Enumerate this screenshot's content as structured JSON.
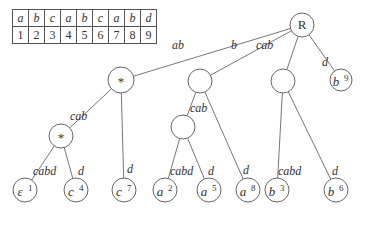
{
  "table": {
    "letters": [
      "a",
      "b",
      "c",
      "a",
      "b",
      "c",
      "a",
      "b",
      "d"
    ],
    "positions": [
      "1",
      "2",
      "3",
      "4",
      "5",
      "6",
      "7",
      "8",
      "9"
    ]
  },
  "tree": {
    "nodes": [
      {
        "id": "root",
        "label": "R",
        "sup": ""
      },
      {
        "id": "n_ab",
        "label": "*",
        "sup": ""
      },
      {
        "id": "n_b",
        "label": "",
        "sup": ""
      },
      {
        "id": "n_cab",
        "label": "",
        "sup": ""
      },
      {
        "id": "leaf_b9",
        "label": "b",
        "sup": "9"
      },
      {
        "id": "n_ab_cab",
        "label": "*",
        "sup": ""
      },
      {
        "id": "n_b_cab",
        "label": "",
        "sup": ""
      },
      {
        "id": "leaf_e1",
        "label": "ε",
        "sup": "1"
      },
      {
        "id": "leaf_c4",
        "label": "c",
        "sup": "4"
      },
      {
        "id": "leaf_c7",
        "label": "c",
        "sup": "7"
      },
      {
        "id": "leaf_a2",
        "label": "a",
        "sup": "2"
      },
      {
        "id": "leaf_a5",
        "label": "a",
        "sup": "5"
      },
      {
        "id": "leaf_a8",
        "label": "a",
        "sup": "8"
      },
      {
        "id": "leaf_b3",
        "label": "b",
        "sup": "3"
      },
      {
        "id": "leaf_b6",
        "label": "b",
        "sup": "6"
      }
    ],
    "edges": [
      {
        "from": "root",
        "to": "n_ab",
        "label": "ab"
      },
      {
        "from": "root",
        "to": "n_b",
        "label": "b"
      },
      {
        "from": "root",
        "to": "n_cab",
        "label": "cab"
      },
      {
        "from": "root",
        "to": "leaf_b9",
        "label": "d"
      },
      {
        "from": "n_ab",
        "to": "n_ab_cab",
        "label": "cab"
      },
      {
        "from": "n_ab",
        "to": "leaf_c7",
        "label": "d"
      },
      {
        "from": "n_ab_cab",
        "to": "leaf_e1",
        "label": "cabd"
      },
      {
        "from": "n_ab_cab",
        "to": "leaf_c4",
        "label": "d"
      },
      {
        "from": "n_b",
        "to": "n_b_cab",
        "label": "cab"
      },
      {
        "from": "n_b",
        "to": "leaf_a8",
        "label": "d"
      },
      {
        "from": "n_b_cab",
        "to": "leaf_a2",
        "label": "cabd"
      },
      {
        "from": "n_b_cab",
        "to": "leaf_a5",
        "label": "d"
      },
      {
        "from": "n_cab",
        "to": "leaf_b3",
        "label": "cabd"
      },
      {
        "from": "n_cab",
        "to": "leaf_b6",
        "label": "d"
      }
    ]
  }
}
